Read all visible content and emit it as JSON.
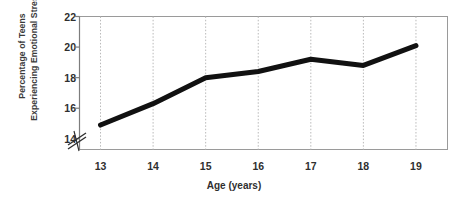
{
  "chart_data": {
    "type": "line",
    "title": "",
    "xlabel": "Age (years)",
    "ylabel": "Percentage of Teens Experiencing Emotional Stress",
    "ylabel_line1": "Percentage of Teens",
    "ylabel_line2": "Experiencing Emotional Stress",
    "categories": [
      13,
      14,
      15,
      16,
      17,
      18,
      19
    ],
    "x": [
      13,
      14,
      15,
      16,
      17,
      18,
      19
    ],
    "values": [
      14.9,
      16.3,
      18.0,
      18.4,
      19.2,
      18.8,
      20.1
    ],
    "series": [
      {
        "name": "Percentage of Teens Experiencing Emotional Stress",
        "values": [
          14.9,
          16.3,
          18.0,
          18.4,
          19.2,
          18.8,
          20.1
        ]
      }
    ],
    "xlim": [
      12.6,
      19.6
    ],
    "ylim": [
      13.3,
      22.0
    ],
    "xticks": [
      13,
      14,
      15,
      16,
      17,
      18,
      19
    ],
    "xtick_labels": [
      "13",
      "14",
      "15",
      "16",
      "17",
      "18",
      "19"
    ],
    "yticks": [
      14,
      16,
      18,
      20,
      22
    ],
    "ytick_labels": [
      "14",
      "16",
      "18",
      "20",
      "22"
    ],
    "grid": "vertical-dotted",
    "axis_break": true,
    "axis_break_axis": "y",
    "legend": "none",
    "line_color": "#111111",
    "line_width": 5,
    "grid_color": "#b9b9b9",
    "axis_color": "#9a9a9a",
    "text_color": "#2f2f2f",
    "background": "#ffffff"
  }
}
